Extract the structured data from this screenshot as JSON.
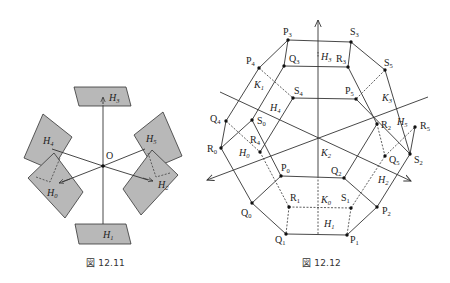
{
  "figures": [
    {
      "id": "fig-12-11",
      "caption": "図 12.11",
      "origin_label": "O",
      "planes": [
        {
          "name": "H",
          "sub": "3"
        },
        {
          "name": "H",
          "sub": "4"
        },
        {
          "name": "H",
          "sub": "5"
        },
        {
          "name": "H",
          "sub": "0"
        },
        {
          "name": "H",
          "sub": "2"
        },
        {
          "name": "H",
          "sub": "1"
        }
      ]
    },
    {
      "id": "fig-12-12",
      "caption": "図 12.12",
      "vertices": [
        {
          "name": "P",
          "sub": "3"
        },
        {
          "name": "S",
          "sub": "3"
        },
        {
          "name": "Q",
          "sub": "3"
        },
        {
          "name": "R",
          "sub": "3"
        },
        {
          "name": "P",
          "sub": "4"
        },
        {
          "name": "S",
          "sub": "5"
        },
        {
          "name": "S",
          "sub": "4"
        },
        {
          "name": "P",
          "sub": "5"
        },
        {
          "name": "Q",
          "sub": "4"
        },
        {
          "name": "S",
          "sub": "0"
        },
        {
          "name": "R",
          "sub": "2"
        },
        {
          "name": "R",
          "sub": "5"
        },
        {
          "name": "R",
          "sub": "0"
        },
        {
          "name": "R",
          "sub": "4"
        },
        {
          "name": "Q",
          "sub": "5"
        },
        {
          "name": "S",
          "sub": "2"
        },
        {
          "name": "P",
          "sub": "0"
        },
        {
          "name": "Q",
          "sub": "2"
        },
        {
          "name": "Q",
          "sub": "0"
        },
        {
          "name": "R",
          "sub": "1"
        },
        {
          "name": "S",
          "sub": "1"
        },
        {
          "name": "P",
          "sub": "2"
        },
        {
          "name": "Q",
          "sub": "1"
        },
        {
          "name": "P",
          "sub": "1"
        }
      ],
      "face_labels": [
        {
          "name": "H",
          "sub": "3"
        },
        {
          "name": "K",
          "sub": "1"
        },
        {
          "name": "H",
          "sub": "4"
        },
        {
          "name": "K",
          "sub": "3"
        },
        {
          "name": "H",
          "sub": "5"
        },
        {
          "name": "H",
          "sub": "0"
        },
        {
          "name": "K",
          "sub": "2"
        },
        {
          "name": "H",
          "sub": "2"
        },
        {
          "name": "K",
          "sub": "0"
        },
        {
          "name": "H",
          "sub": "1"
        }
      ]
    }
  ],
  "colors": {
    "plane_fill": "#b8b8b8",
    "line": "#333333",
    "background": "#ffffff"
  }
}
